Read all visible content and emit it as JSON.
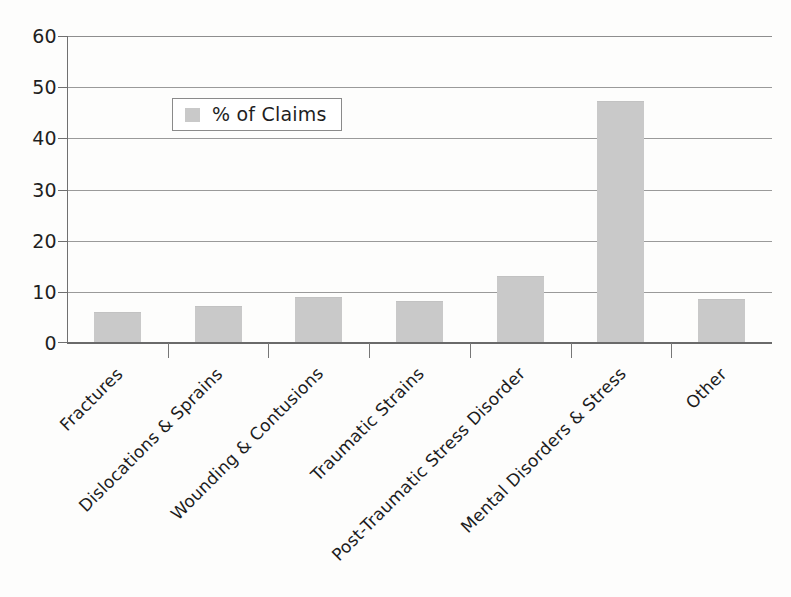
{
  "chart_data": {
    "type": "bar",
    "title": "",
    "xlabel": "",
    "ylabel": "",
    "ylim": [
      0,
      60
    ],
    "yticks": [
      0,
      10,
      20,
      30,
      40,
      50,
      60
    ],
    "grid": true,
    "legend_position": "upper-left-inside",
    "categories": [
      "Fractures",
      "Dislocations & Sprains",
      "Wounding & Contusions",
      "Traumatic Strains",
      "Post-Traumatic Stress Disorder",
      "Mental Disorders & Stress",
      "Other"
    ],
    "series": [
      {
        "name": "% of Claims",
        "values": [
          5.6,
          6.9,
          8.6,
          7.8,
          12.8,
          46.9,
          8.2
        ],
        "color": "#c9c9c9"
      }
    ]
  },
  "legend": {
    "entries": [
      {
        "label": "% of Claims",
        "swatch_color": "#c9c9c9"
      }
    ]
  },
  "axis": {
    "y_tick_labels": [
      "60",
      "50",
      "40",
      "30",
      "20",
      "10",
      "0"
    ]
  },
  "colors": {
    "bar_fill": "#c9c9c9",
    "gridline": "#8e8e8e",
    "axis": "#6f6f6f",
    "text": "#1f1f1f",
    "background": "#fdfdfc"
  }
}
